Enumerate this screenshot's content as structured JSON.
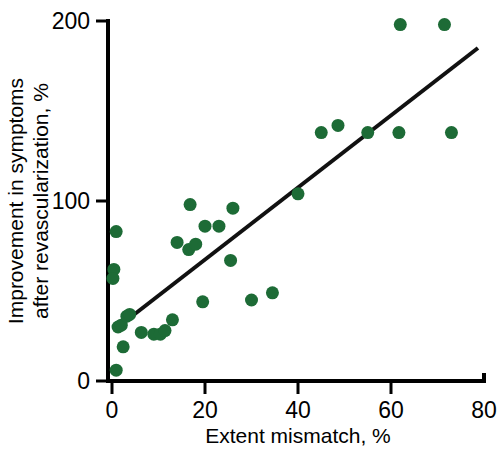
{
  "figure": {
    "background_color": "#ffffff",
    "point_color": "#1d6b36",
    "line_color": "#111111",
    "axis_color": "#000000"
  },
  "chart_data": {
    "type": "scatter",
    "title": "",
    "xlabel": "Extent mismatch, %",
    "ylabel_line1": "Improvement in symptoms",
    "ylabel_line2": "after revascularization, %",
    "xlim": [
      0,
      80
    ],
    "ylim": [
      0,
      200
    ],
    "xticks": [
      0,
      20,
      40,
      60,
      80
    ],
    "xtick_labels": [
      "0",
      "20",
      "40",
      "60",
      "80"
    ],
    "yticks": [
      0,
      100,
      200
    ],
    "ytick_labels": [
      "0",
      "100",
      "200"
    ],
    "grid": false,
    "legend": null,
    "marker": "circle",
    "marker_color": "#1d6b36",
    "points": [
      {
        "x": 0.9,
        "y": 83
      },
      {
        "x": 0.4,
        "y": 62
      },
      {
        "x": 0.2,
        "y": 57
      },
      {
        "x": 1.3,
        "y": 30
      },
      {
        "x": 2.0,
        "y": 31
      },
      {
        "x": 3.2,
        "y": 36
      },
      {
        "x": 3.8,
        "y": 37
      },
      {
        "x": 2.4,
        "y": 19
      },
      {
        "x": 0.9,
        "y": 6
      },
      {
        "x": 6.3,
        "y": 27
      },
      {
        "x": 9.0,
        "y": 26
      },
      {
        "x": 10.4,
        "y": 26
      },
      {
        "x": 11.4,
        "y": 28
      },
      {
        "x": 13.0,
        "y": 34
      },
      {
        "x": 14.0,
        "y": 77
      },
      {
        "x": 16.8,
        "y": 98
      },
      {
        "x": 16.5,
        "y": 73
      },
      {
        "x": 18.0,
        "y": 76
      },
      {
        "x": 20.0,
        "y": 86
      },
      {
        "x": 19.5,
        "y": 44
      },
      {
        "x": 23.0,
        "y": 86
      },
      {
        "x": 26.0,
        "y": 96
      },
      {
        "x": 25.5,
        "y": 67
      },
      {
        "x": 30.0,
        "y": 45
      },
      {
        "x": 34.5,
        "y": 49
      },
      {
        "x": 40.0,
        "y": 104
      },
      {
        "x": 45.0,
        "y": 138
      },
      {
        "x": 48.6,
        "y": 142
      },
      {
        "x": 55.0,
        "y": 138
      },
      {
        "x": 61.7,
        "y": 138
      },
      {
        "x": 62.0,
        "y": 198
      },
      {
        "x": 71.5,
        "y": 198
      },
      {
        "x": 73.0,
        "y": 138
      }
    ],
    "trendline": {
      "x_start": 1.3,
      "y_start": 30,
      "x_end": 78.7,
      "y_end": 185
    },
    "annotations": []
  }
}
